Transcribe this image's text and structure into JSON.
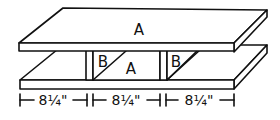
{
  "diagram": {
    "type": "shelf-assembly-drawing",
    "parts": {
      "top_board": {
        "label": "A"
      },
      "middle_board": {
        "label": "A"
      },
      "brace_left": {
        "label": "B"
      },
      "brace_right": {
        "label": "B"
      }
    },
    "dimensions": [
      {
        "label": "8¼\""
      },
      {
        "label": "8¼\""
      },
      {
        "label": "8¼\""
      }
    ],
    "colors": {
      "line": "#111111",
      "background": "#ffffff"
    }
  }
}
